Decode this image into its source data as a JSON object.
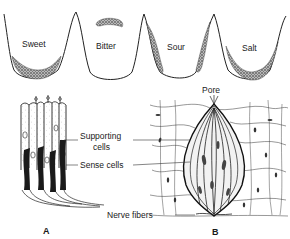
{
  "taste_regions": {
    "sweet": "Sweet",
    "bitter": "Bitter",
    "sour": "Sour",
    "salt": "Salt"
  },
  "labels": {
    "pore": "Pore",
    "supporting_cells_1": "Supporting",
    "supporting_cells_2": "cells",
    "sense_cells": "Sense cells",
    "nerve_fibers": "Nerve fibers",
    "panel_a": "A",
    "panel_b": "B"
  }
}
